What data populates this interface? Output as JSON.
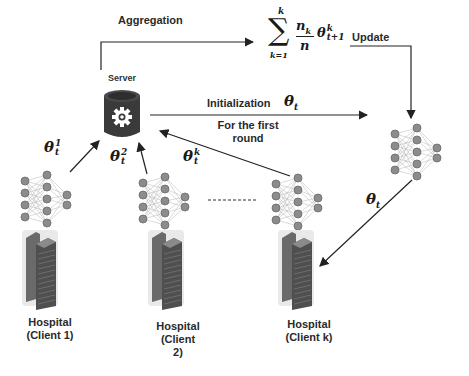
{
  "diagram": {
    "type": "federated-learning-workflow",
    "labels": {
      "aggregation": "Aggregation",
      "update": "Update",
      "server": "Server",
      "initialization": "Initialization",
      "first_round_line1": "For the first",
      "first_round_line2": "round"
    },
    "formula": {
      "sum_upper": "k",
      "sum_lower": "k=1",
      "numerator": "n",
      "numerator_sub": "k",
      "denominator": "n",
      "theta": "θ",
      "theta_sup": "k",
      "theta_sub": "t+1"
    },
    "init_param": {
      "symbol": "θ",
      "sub": "t"
    },
    "global_to_client_param": {
      "symbol": "θ",
      "sub": "t"
    },
    "client_params": [
      {
        "symbol": "θ",
        "sup": "1",
        "sub": "t"
      },
      {
        "symbol": "θ",
        "sup": "2",
        "sub": "t"
      },
      {
        "symbol": "θ",
        "sup": "k",
        "sub": "t"
      }
    ],
    "clients": [
      {
        "line1": "Hospital",
        "line2": "(Client 1)",
        "line3": ""
      },
      {
        "line1": "Hospital",
        "line2": "(Client",
        "line3": "2)"
      },
      {
        "line1": "Hospital",
        "line2": "(Client k)",
        "line3": ""
      }
    ],
    "colors": {
      "server_body": "#3a3a3a",
      "server_top": "#4a4a4a",
      "node_fill": "#8c8c8c",
      "node_stroke": "#6a6a6a",
      "building": "#555555",
      "arrow": "#222222"
    }
  }
}
